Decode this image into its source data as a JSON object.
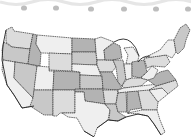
{
  "image": {
    "description": "Grayscale clip-art map of the contiguous United States with a decorative wavy polka-dot border along the top",
    "palette": {
      "light": "#efefef",
      "mid_light": "#dcdcdc",
      "mid": "#c8c8c8",
      "dark": "#b3b3b3",
      "border": "#333333",
      "dots": "#bdbdbd"
    },
    "border_dots_count": 6,
    "states": [
      {
        "name": "washington",
        "shade": "mid_light"
      },
      {
        "name": "oregon",
        "shade": "mid"
      },
      {
        "name": "california",
        "shade": "light"
      },
      {
        "name": "idaho",
        "shade": "dark"
      },
      {
        "name": "nevada",
        "shade": "mid"
      },
      {
        "name": "montana",
        "shade": "light"
      },
      {
        "name": "wyoming",
        "shade": "mid_light"
      },
      {
        "name": "utah",
        "shade": "light"
      },
      {
        "name": "arizona",
        "shade": "mid"
      },
      {
        "name": "colorado",
        "shade": "dark"
      },
      {
        "name": "new-mexico",
        "shade": "mid_light"
      },
      {
        "name": "north-dakota",
        "shade": "dark"
      },
      {
        "name": "south-dakota",
        "shade": "mid"
      },
      {
        "name": "nebraska",
        "shade": "light"
      },
      {
        "name": "kansas",
        "shade": "mid"
      },
      {
        "name": "oklahoma",
        "shade": "dark"
      },
      {
        "name": "texas",
        "shade": "light"
      },
      {
        "name": "minnesota",
        "shade": "light"
      },
      {
        "name": "iowa",
        "shade": "mid_light"
      },
      {
        "name": "missouri",
        "shade": "dark"
      },
      {
        "name": "arkansas",
        "shade": "mid_light"
      },
      {
        "name": "louisiana",
        "shade": "mid"
      },
      {
        "name": "wisconsin",
        "shade": "dark"
      },
      {
        "name": "illinois",
        "shade": "mid"
      },
      {
        "name": "michigan",
        "shade": "light"
      },
      {
        "name": "indiana",
        "shade": "light"
      },
      {
        "name": "ohio",
        "shade": "dark"
      },
      {
        "name": "kentucky",
        "shade": "mid_light"
      },
      {
        "name": "tennessee",
        "shade": "light"
      },
      {
        "name": "mississippi",
        "shade": "mid"
      },
      {
        "name": "alabama",
        "shade": "dark"
      },
      {
        "name": "georgia",
        "shade": "mid_light"
      },
      {
        "name": "florida",
        "shade": "light"
      },
      {
        "name": "south-carolina",
        "shade": "light"
      },
      {
        "name": "north-carolina",
        "shade": "mid_light"
      },
      {
        "name": "virginia",
        "shade": "dark"
      },
      {
        "name": "west-virginia",
        "shade": "light"
      },
      {
        "name": "pennsylvania",
        "shade": "mid_light"
      },
      {
        "name": "new-york",
        "shade": "light"
      },
      {
        "name": "new-england",
        "shade": "mid"
      }
    ]
  }
}
